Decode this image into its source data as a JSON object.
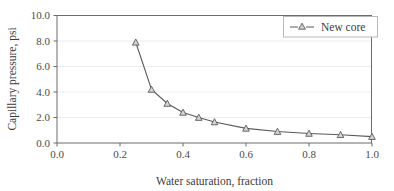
{
  "chart_data": {
    "type": "line",
    "title": "",
    "xlabel": "Water saturation, fraction",
    "ylabel": "Capillary pressure, psi",
    "xlim": [
      0.0,
      1.0
    ],
    "ylim": [
      0.0,
      10.0
    ],
    "xticks": [
      "0.0",
      "0.2",
      "0.4",
      "0.6",
      "0.8",
      "1.0"
    ],
    "xtick_values": [
      0.0,
      0.2,
      0.4,
      0.6,
      0.8,
      1.0
    ],
    "yticks": [
      "0.0",
      "2.0",
      "4.0",
      "6.0",
      "8.0",
      "10.0"
    ],
    "ytick_values": [
      0.0,
      2.0,
      4.0,
      6.0,
      8.0,
      10.0
    ],
    "grid": "horizontal",
    "legend_position": "top-right",
    "marker": "triangle-up",
    "series": [
      {
        "name": "New core",
        "color": "#5a5a5a",
        "x": [
          0.25,
          0.3,
          0.35,
          0.4,
          0.45,
          0.5,
          0.6,
          0.7,
          0.8,
          0.9,
          1.0
        ],
        "values": [
          7.9,
          4.2,
          3.1,
          2.4,
          2.0,
          1.65,
          1.15,
          0.9,
          0.75,
          0.65,
          0.5
        ]
      }
    ]
  },
  "legend": {
    "entries": [
      {
        "label": "New core"
      }
    ]
  },
  "axes": {
    "x_title": "Water saturation, fraction",
    "y_title": "Capillary pressure, psi"
  }
}
